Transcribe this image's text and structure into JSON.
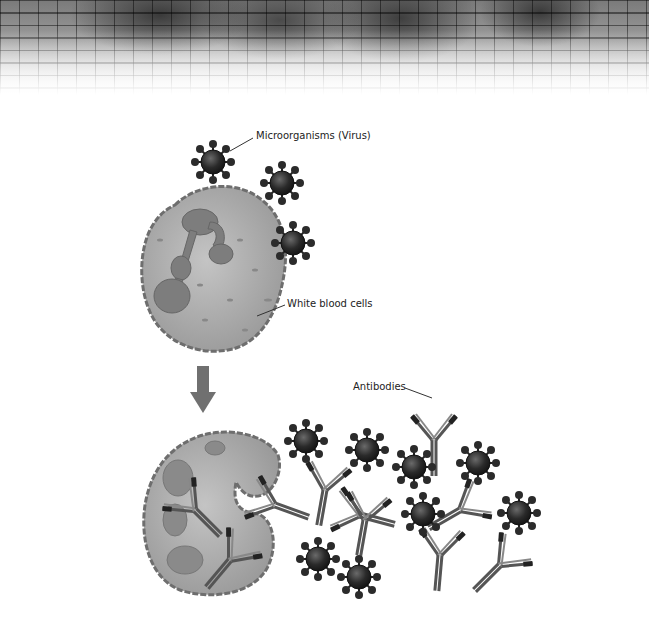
{
  "labels": {
    "microorganisms": "Microorganisms (Virus)",
    "white_blood_cells": "White blood cells",
    "antibodies": "Antibodies"
  },
  "colors": {
    "virus_body": "#2a2a2a",
    "cell_fill": "#a8a8a8",
    "cell_outline": "#6e6e6e",
    "nucleus": "#7d7d7d",
    "arrow": "#707070",
    "antibody": "#555555"
  }
}
